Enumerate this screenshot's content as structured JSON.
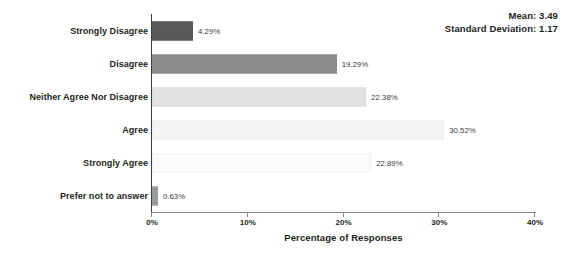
{
  "chart_data": {
    "type": "bar",
    "orientation": "horizontal",
    "title": "",
    "xlabel": "Percentage of Responses",
    "ylabel": "",
    "xlim": [
      0,
      40
    ],
    "grid": false,
    "legend": null,
    "categories": [
      "Strongly Disagree",
      "Disagree",
      "Neither Agree Nor Disagree",
      "Agree",
      "Strongly Agree",
      "Prefer not to answer"
    ],
    "values": [
      4.29,
      19.29,
      22.38,
      30.52,
      22.89,
      0.63
    ],
    "value_labels": [
      "4.29%",
      "19.29%",
      "22.38%",
      "30.52%",
      "22.89%",
      "0.63%"
    ],
    "bar_colors": [
      "#595959",
      "#8c8c8c",
      "#e2e2e2",
      "#f4f4f4",
      "#fbfbfb",
      "#9a9a9a"
    ],
    "bar_border_colors": [
      "#595959",
      "#8c8c8c",
      "#dcdcdc",
      "#ededed",
      "#f0f0f0",
      "#9a9a9a"
    ],
    "xticks": [
      0,
      10,
      20,
      30,
      40
    ],
    "xtick_labels": [
      "0%",
      "10%",
      "20%",
      "30%",
      "40%"
    ]
  },
  "annotations": {
    "mean_text": "Mean: 3.49",
    "std_text": "Standard Deviation: 1.17"
  },
  "colors": {
    "axis": "#8a8a8a",
    "text": "#231f20"
  }
}
